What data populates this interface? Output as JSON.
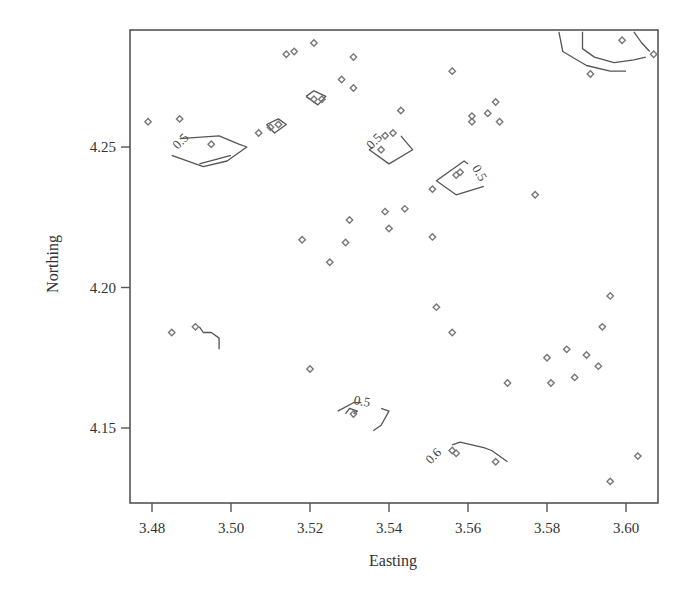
{
  "chart_data": {
    "type": "scatter",
    "title": "",
    "xlabel": "Easting",
    "ylabel": "Northing",
    "xlim": [
      3.474,
      3.607
    ],
    "ylim": [
      4.123,
      4.291
    ],
    "xticks": [
      3.48,
      3.5,
      3.52,
      3.54,
      3.56,
      3.58,
      3.6
    ],
    "xtick_labels": [
      "3.48",
      "3.50",
      "3.52",
      "3.54",
      "3.56",
      "3.58",
      "3.60"
    ],
    "yticks": [
      4.15,
      4.2,
      4.25
    ],
    "ytick_labels": [
      "4.15",
      "4.20",
      "4.25"
    ],
    "grid": false,
    "legend": null,
    "marker": "open-diamond",
    "colors": {
      "points": "#777777",
      "contours": "#555555",
      "axes": "#555555"
    },
    "series": [
      {
        "name": "sample locations",
        "points": [
          [
            3.479,
            4.259
          ],
          [
            3.487,
            4.26
          ],
          [
            3.495,
            4.251
          ],
          [
            3.485,
            4.184
          ],
          [
            3.491,
            4.186
          ],
          [
            3.514,
            4.283
          ],
          [
            3.516,
            4.284
          ],
          [
            3.521,
            4.287
          ],
          [
            3.531,
            4.282
          ],
          [
            3.528,
            4.274
          ],
          [
            3.531,
            4.271
          ],
          [
            3.507,
            4.255
          ],
          [
            3.51,
            4.257
          ],
          [
            3.512,
            4.258
          ],
          [
            3.521,
            4.267
          ],
          [
            3.523,
            4.267
          ],
          [
            3.539,
            4.254
          ],
          [
            3.541,
            4.255
          ],
          [
            3.543,
            4.263
          ],
          [
            3.538,
            4.249
          ],
          [
            3.556,
            4.277
          ],
          [
            3.561,
            4.261
          ],
          [
            3.561,
            4.259
          ],
          [
            3.565,
            4.262
          ],
          [
            3.567,
            4.266
          ],
          [
            3.568,
            4.259
          ],
          [
            3.557,
            4.24
          ],
          [
            3.558,
            4.241
          ],
          [
            3.551,
            4.235
          ],
          [
            3.577,
            4.233
          ],
          [
            3.518,
            4.217
          ],
          [
            3.525,
            4.209
          ],
          [
            3.529,
            4.216
          ],
          [
            3.53,
            4.224
          ],
          [
            3.539,
            4.227
          ],
          [
            3.54,
            4.221
          ],
          [
            3.544,
            4.228
          ],
          [
            3.551,
            4.218
          ],
          [
            3.552,
            4.193
          ],
          [
            3.556,
            4.184
          ],
          [
            3.52,
            4.171
          ],
          [
            3.531,
            4.155
          ],
          [
            3.57,
            4.166
          ],
          [
            3.58,
            4.175
          ],
          [
            3.581,
            4.166
          ],
          [
            3.585,
            4.178
          ],
          [
            3.587,
            4.168
          ],
          [
            3.59,
            4.176
          ],
          [
            3.593,
            4.172
          ],
          [
            3.594,
            4.186
          ],
          [
            3.596,
            4.197
          ],
          [
            3.556,
            4.142
          ],
          [
            3.557,
            4.141
          ],
          [
            3.567,
            4.138
          ],
          [
            3.596,
            4.131
          ],
          [
            3.603,
            4.14
          ],
          [
            3.591,
            4.276
          ],
          [
            3.599,
            4.288
          ],
          [
            3.607,
            4.283
          ]
        ]
      }
    ],
    "contours": [
      {
        "level": "0.5",
        "label": "0.5",
        "label_pos": [
          3.488,
          4.251
        ],
        "label_rot": -45,
        "path": [
          [
            3.487,
            4.253
          ],
          [
            3.497,
            4.254
          ],
          [
            3.502,
            4.251
          ],
          [
            3.504,
            4.25
          ],
          [
            3.499,
            4.245
          ],
          [
            3.493,
            4.243
          ],
          [
            3.485,
            4.247
          ]
        ]
      },
      {
        "level": "0.5",
        "label": "",
        "path": [
          [
            3.492,
            4.244
          ],
          [
            3.5,
            4.247
          ]
        ]
      },
      {
        "level": "0.5",
        "label": "",
        "path": [
          [
            3.509,
            4.258
          ],
          [
            3.512,
            4.26
          ],
          [
            3.514,
            4.258
          ],
          [
            3.511,
            4.255
          ],
          [
            3.509,
            4.258
          ]
        ]
      },
      {
        "level": "0.5",
        "label": "",
        "path": [
          [
            3.519,
            4.268
          ],
          [
            3.521,
            4.27
          ],
          [
            3.524,
            4.268
          ],
          [
            3.522,
            4.265
          ],
          [
            3.519,
            4.268
          ]
        ]
      },
      {
        "level": "0.5",
        "label": "0.5",
        "label_pos": [
          3.537,
          4.251
        ],
        "label_rot": -45,
        "path": [
          [
            3.536,
            4.25
          ],
          [
            3.535,
            4.249
          ],
          [
            3.54,
            4.244
          ],
          [
            3.546,
            4.249
          ],
          [
            3.543,
            4.254
          ]
        ]
      },
      {
        "level": "0.5",
        "label": "0.5",
        "label_pos": [
          3.562,
          4.24
        ],
        "label_rot": 60,
        "path": [
          [
            3.56,
            4.244
          ],
          [
            3.559,
            4.245
          ],
          [
            3.552,
            4.238
          ],
          [
            3.557,
            4.233
          ],
          [
            3.564,
            4.236
          ]
        ]
      },
      {
        "level": "0.5",
        "label": "0.5",
        "label_pos": [
          3.533,
          4.158
        ],
        "label_rot": 10,
        "path": [
          [
            3.527,
            4.156
          ],
          [
            3.531,
            4.159
          ],
          [
            3.533,
            4.159
          ]
        ]
      },
      {
        "level": "0.5",
        "label": "",
        "path": [
          [
            3.529,
            4.155
          ],
          [
            3.53,
            4.157
          ],
          [
            3.532,
            4.156
          ],
          [
            3.531,
            4.155
          ]
        ]
      },
      {
        "level": "0.5",
        "label": "",
        "path": [
          [
            3.538,
            4.157
          ],
          [
            3.54,
            4.156
          ],
          [
            3.538,
            4.151
          ],
          [
            3.536,
            4.149
          ]
        ]
      },
      {
        "level": "0.6",
        "label": "0.6",
        "label_pos": [
          3.552,
          4.139
        ],
        "label_rot": -45,
        "path": [
          [
            3.556,
            4.144
          ],
          [
            3.558,
            4.145
          ],
          [
            3.564,
            4.143
          ],
          [
            3.566,
            4.142
          ],
          [
            3.57,
            4.138
          ]
        ]
      },
      {
        "level": "",
        "label": "",
        "path": [
          [
            3.492,
            4.186
          ],
          [
            3.493,
            4.184
          ],
          [
            3.495,
            4.184
          ],
          [
            3.497,
            4.182
          ],
          [
            3.497,
            4.178
          ]
        ]
      },
      {
        "level": "",
        "label": "",
        "path": [
          [
            3.589,
            4.291
          ],
          [
            3.589,
            4.285
          ],
          [
            3.592,
            4.282
          ],
          [
            3.597,
            4.28
          ],
          [
            3.602,
            4.281
          ],
          [
            3.605,
            4.282
          ]
        ]
      },
      {
        "level": "",
        "label": "",
        "path": [
          [
            3.583,
            4.291
          ],
          [
            3.584,
            4.284
          ],
          [
            3.59,
            4.279
          ],
          [
            3.596,
            4.277
          ],
          [
            3.6,
            4.277
          ]
        ]
      },
      {
        "level": "",
        "label": "",
        "path": [
          [
            3.602,
            4.291
          ],
          [
            3.604,
            4.287
          ],
          [
            3.606,
            4.284
          ]
        ]
      }
    ]
  }
}
